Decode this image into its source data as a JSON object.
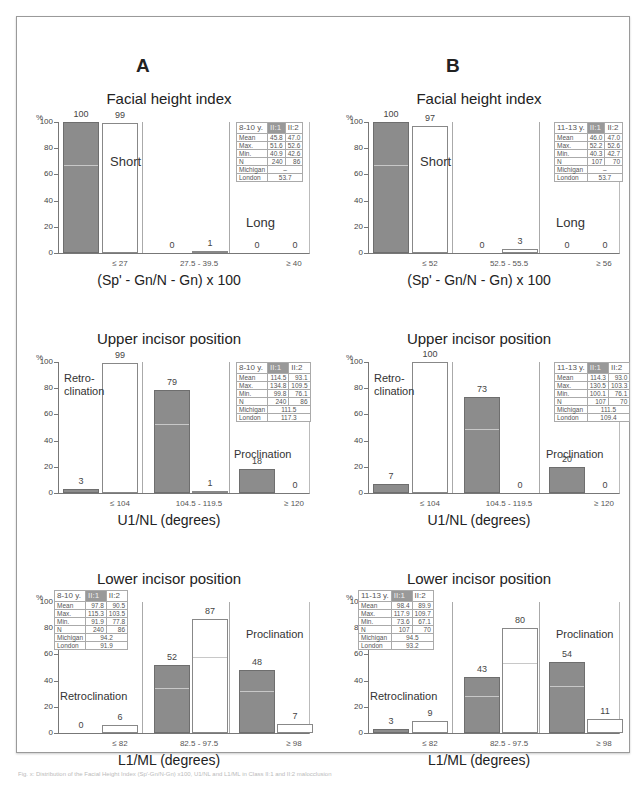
{
  "columns": {
    "a_label": "A",
    "b_label": "B"
  },
  "caption": "Fig. x: Distribution of the Facial Height Index (Sp'-Gn/N-Gn) x100, U1/NL and L1/ML in Class II:1 and II:2 malocclusion",
  "charts": {
    "facial_a": {
      "title": "Facial height index",
      "ylabel": "%",
      "yticks": [
        "100",
        "80",
        "60",
        "40",
        "20",
        "0"
      ],
      "xlabel": "(Sp' - Gn/N - Gn) x 100",
      "xticks": [
        "≤ 27",
        "27.5  -  39.5",
        "≥ 40"
      ],
      "annotations": {
        "left": "Short",
        "right": "Long"
      },
      "bars": [
        {
          "v": 100,
          "label": "100"
        },
        {
          "v": 99,
          "label": "99"
        },
        {
          "v": 0,
          "label": "0"
        },
        {
          "v": 1,
          "label": "1"
        },
        {
          "v": 0,
          "label": "0"
        },
        {
          "v": 0,
          "label": "0"
        }
      ],
      "table": {
        "age": "8-10 y.",
        "h1": "II:1",
        "h2": "II:2",
        "rows": [
          [
            "Mean",
            "45.8",
            "47.0"
          ],
          [
            "Max.",
            "51.6",
            "52.6"
          ],
          [
            "Min.",
            "40.9",
            "42.6"
          ],
          [
            "N",
            "240",
            "86"
          ]
        ],
        "michigan_label": "Michigan",
        "michigan": "–",
        "london_label": "London",
        "london": "53.7"
      }
    },
    "facial_b": {
      "title": "Facial height index",
      "ylabel": "%",
      "yticks": [
        "100",
        "80",
        "60",
        "40",
        "20",
        "0"
      ],
      "xlabel": "(Sp' - Gn/N - Gn) x 100",
      "xticks": [
        "≤ 52",
        "52.5  -  55.5",
        "≥ 56"
      ],
      "annotations": {
        "left": "Short",
        "right": "Long"
      },
      "bars": [
        {
          "v": 100,
          "label": "100"
        },
        {
          "v": 97,
          "label": "97"
        },
        {
          "v": 0,
          "label": "0"
        },
        {
          "v": 3,
          "label": "3"
        },
        {
          "v": 0,
          "label": "0"
        },
        {
          "v": 0,
          "label": "0"
        }
      ],
      "table": {
        "age": "11-13 y.",
        "h1": "II:1",
        "h2": "II:2",
        "rows": [
          [
            "Mean",
            "46.0",
            "47.0"
          ],
          [
            "Max.",
            "52.2",
            "52.6"
          ],
          [
            "Min.",
            "40.3",
            "42.7"
          ],
          [
            "N",
            "107",
            "70"
          ]
        ],
        "michigan_label": "Michigan",
        "michigan": "–",
        "london_label": "London",
        "london": "53.7"
      }
    },
    "upper_a": {
      "title": "Upper incisor position",
      "ylabel": "%",
      "yticks": [
        "100",
        "80",
        "60",
        "40",
        "20",
        "0"
      ],
      "xlabel": "U1/NL (degrees)",
      "xticks": [
        "≤ 104",
        "104.5  -  119.5",
        "≥ 120"
      ],
      "annotations": {
        "left": "Retro-\nclination",
        "right": "Proclination"
      },
      "bars": [
        {
          "v": 3,
          "label": "3"
        },
        {
          "v": 99,
          "label": "99"
        },
        {
          "v": 79,
          "label": "79"
        },
        {
          "v": 1,
          "label": "1"
        },
        {
          "v": 18,
          "label": "18"
        },
        {
          "v": 0,
          "label": "0"
        }
      ],
      "table": {
        "age": "8-10 y.",
        "h1": "II:1",
        "h2": "II:2",
        "rows": [
          [
            "Mean",
            "114.5",
            "93.1"
          ],
          [
            "Max.",
            "134.8",
            "109.5"
          ],
          [
            "Min.",
            "99.8",
            "76.1"
          ],
          [
            "N",
            "240",
            "86"
          ]
        ],
        "michigan_label": "Michigan",
        "michigan": "111.5",
        "london_label": "London",
        "london": "117.3"
      }
    },
    "upper_b": {
      "title": "Upper incisor position",
      "ylabel": "%",
      "yticks": [
        "100",
        "80",
        "60",
        "40",
        "20",
        "0"
      ],
      "xlabel": "U1/NL (degrees)",
      "xticks": [
        "≤ 104",
        "104.5  -  119.5",
        "≥ 120"
      ],
      "annotations": {
        "left": "Retro-\nclination",
        "right": "Proclination"
      },
      "bars": [
        {
          "v": 7,
          "label": "7"
        },
        {
          "v": 100,
          "label": "100"
        },
        {
          "v": 73,
          "label": "73"
        },
        {
          "v": 0,
          "label": "0"
        },
        {
          "v": 20,
          "label": "20"
        },
        {
          "v": 0,
          "label": "0"
        }
      ],
      "table": {
        "age": "11-13 y.",
        "h1": "II:1",
        "h2": "II:2",
        "rows": [
          [
            "Mean",
            "114.3",
            "93.0"
          ],
          [
            "Max.",
            "130.5",
            "103.3"
          ],
          [
            "Min.",
            "100.1",
            "76.1"
          ],
          [
            "N",
            "107",
            "70"
          ]
        ],
        "michigan_label": "Michigan",
        "michigan": "111.5",
        "london_label": "London",
        "london": "109.4"
      }
    },
    "lower_a": {
      "title": "Lower incisor position",
      "ylabel": "%",
      "yticks": [
        "100",
        "80",
        "60",
        "40",
        "20",
        "0"
      ],
      "xlabel": "L1/ML (degrees)",
      "xticks": [
        "≤ 82",
        "82.5  -  97.5",
        "≥ 98"
      ],
      "annotations": {
        "left": "Retroclination",
        "right": "Proclination"
      },
      "bars": [
        {
          "v": 0,
          "label": "0"
        },
        {
          "v": 6,
          "label": "6"
        },
        {
          "v": 52,
          "label": "52"
        },
        {
          "v": 87,
          "label": "87"
        },
        {
          "v": 48,
          "label": "48"
        },
        {
          "v": 7,
          "label": "7"
        }
      ],
      "table": {
        "age": "8-10 y.",
        "h1": "II:1",
        "h2": "II:2",
        "rows": [
          [
            "Mean",
            "97.8",
            "90.5"
          ],
          [
            "Max.",
            "115.3",
            "103.5"
          ],
          [
            "Min.",
            "91.9",
            "77.8"
          ],
          [
            "N",
            "240",
            "86"
          ]
        ],
        "michigan_label": "Michigan",
        "michigan": "94.2",
        "london_label": "London",
        "london": "91.9"
      }
    },
    "lower_b": {
      "title": "Lower incisor position",
      "ylabel": "%",
      "yticks": [
        "100",
        "80",
        "60",
        "40",
        "20",
        "0"
      ],
      "xlabel": "L1/ML (degrees)",
      "xticks": [
        "≤ 82",
        "82.5  -  97.5",
        "≥ 98"
      ],
      "annotations": {
        "left": "Retroclination",
        "right": "Proclination"
      },
      "bars": [
        {
          "v": 3,
          "label": "3"
        },
        {
          "v": 9,
          "label": "9"
        },
        {
          "v": 43,
          "label": "43"
        },
        {
          "v": 80,
          "label": "80"
        },
        {
          "v": 54,
          "label": "54"
        },
        {
          "v": 11,
          "label": "11"
        }
      ],
      "table": {
        "age": "11-13 y.",
        "h1": "II:1",
        "h2": "II:2",
        "rows": [
          [
            "Mean",
            "98.4",
            "89.9"
          ],
          [
            "Max.",
            "117.9",
            "109.7"
          ],
          [
            "Min.",
            "73.6",
            "67.1"
          ],
          [
            "N",
            "107",
            "70"
          ]
        ],
        "michigan_label": "Michigan",
        "michigan": "94.5",
        "london_label": "London",
        "london": "93.2"
      }
    }
  },
  "chart_data": [
    {
      "type": "bar",
      "title": "Facial height index (A, 8-10 y.)",
      "xlabel": "(Sp' - Gn/N - Gn) x 100",
      "ylabel": "%",
      "ylim": [
        0,
        100
      ],
      "categories": [
        "≤ 27",
        "27.5 - 39.5",
        "≥ 40"
      ],
      "series": [
        {
          "name": "II:1",
          "values": [
            100,
            0,
            0
          ]
        },
        {
          "name": "II:2",
          "values": [
            99,
            1,
            0
          ]
        }
      ]
    },
    {
      "type": "bar",
      "title": "Facial height index (B, 11-13 y.)",
      "xlabel": "(Sp' - Gn/N - Gn) x 100",
      "ylabel": "%",
      "ylim": [
        0,
        100
      ],
      "categories": [
        "≤ 52",
        "52.5 - 55.5",
        "≥ 56"
      ],
      "series": [
        {
          "name": "II:1",
          "values": [
            100,
            0,
            0
          ]
        },
        {
          "name": "II:2",
          "values": [
            97,
            3,
            0
          ]
        }
      ]
    },
    {
      "type": "bar",
      "title": "Upper incisor position (A, 8-10 y.)",
      "xlabel": "U1/NL (degrees)",
      "ylabel": "%",
      "ylim": [
        0,
        100
      ],
      "categories": [
        "≤ 104",
        "104.5 - 119.5",
        "≥ 120"
      ],
      "series": [
        {
          "name": "II:1",
          "values": [
            3,
            79,
            18
          ]
        },
        {
          "name": "II:2",
          "values": [
            99,
            1,
            0
          ]
        }
      ]
    },
    {
      "type": "bar",
      "title": "Upper incisor position (B, 11-13 y.)",
      "xlabel": "U1/NL (degrees)",
      "ylabel": "%",
      "ylim": [
        0,
        100
      ],
      "categories": [
        "≤ 104",
        "104.5 - 119.5",
        "≥ 120"
      ],
      "series": [
        {
          "name": "II:1",
          "values": [
            7,
            73,
            20
          ]
        },
        {
          "name": "II:2",
          "values": [
            100,
            0,
            0
          ]
        }
      ]
    },
    {
      "type": "bar",
      "title": "Lower incisor position (A, 8-10 y.)",
      "xlabel": "L1/ML (degrees)",
      "ylabel": "%",
      "ylim": [
        0,
        100
      ],
      "categories": [
        "≤ 82",
        "82.5 - 97.5",
        "≥ 98"
      ],
      "series": [
        {
          "name": "II:1",
          "values": [
            0,
            52,
            48
          ]
        },
        {
          "name": "II:2",
          "values": [
            6,
            87,
            7
          ]
        }
      ]
    },
    {
      "type": "bar",
      "title": "Lower incisor position (B, 11-13 y.)",
      "xlabel": "L1/ML (degrees)",
      "ylabel": "%",
      "ylim": [
        0,
        100
      ],
      "categories": [
        "≤ 82",
        "82.5 - 97.5",
        "≥ 98"
      ],
      "series": [
        {
          "name": "II:1",
          "values": [
            3,
            43,
            54
          ]
        },
        {
          "name": "II:2",
          "values": [
            9,
            80,
            11
          ]
        }
      ]
    }
  ]
}
